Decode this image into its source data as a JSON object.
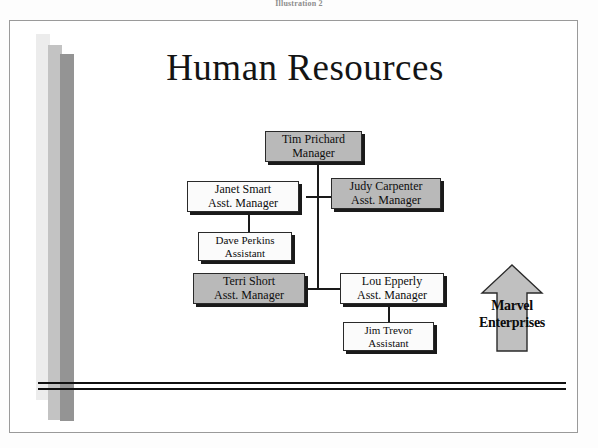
{
  "caption": "Illustration 2",
  "slide": {
    "title": "Human Resources",
    "background_color": "#ffffff",
    "border_color": "#9a9a9a"
  },
  "decor": {
    "bars": [
      {
        "name": "light-bar",
        "color": "#ececec"
      },
      {
        "name": "medium-bar",
        "color": "#c3c3c3"
      },
      {
        "name": "dark-bar",
        "color": "#949494"
      }
    ],
    "rule_color": "#111111"
  },
  "org_chart": {
    "type": "organization-chart",
    "nodes": [
      {
        "id": "tim-prichard",
        "name": "Tim Prichard",
        "role": "Manager",
        "level": 0,
        "fill": "gray",
        "parent": null
      },
      {
        "id": "janet-smart",
        "name": "Janet Smart",
        "role": "Asst. Manager",
        "level": 1,
        "fill": "white",
        "parent": "tim-prichard"
      },
      {
        "id": "judy-carpenter",
        "name": "Judy Carpenter",
        "role": "Asst. Manager",
        "level": 1,
        "fill": "gray",
        "parent": "tim-prichard"
      },
      {
        "id": "dave-perkins",
        "name": "Dave Perkins",
        "role": "Assistant",
        "level": 2,
        "fill": "white",
        "parent": "janet-smart"
      },
      {
        "id": "terri-short",
        "name": "Terri Short",
        "role": "Asst. Manager",
        "level": 1,
        "fill": "gray",
        "parent": "tim-prichard"
      },
      {
        "id": "lou-epperly",
        "name": "Lou Epperly",
        "role": "Asst. Manager",
        "level": 1,
        "fill": "white",
        "parent": "tim-prichard"
      },
      {
        "id": "jim-trevor",
        "name": "Jim Trevor",
        "role": "Assistant",
        "level": 2,
        "fill": "white",
        "parent": "lou-epperly"
      }
    ]
  },
  "callout": {
    "icon": "up-arrow-icon",
    "line1": "Marvel",
    "line2": "Enterprises",
    "fill": "#c0c0c0"
  }
}
